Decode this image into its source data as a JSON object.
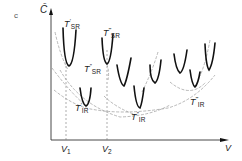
{
  "panel_label": "c",
  "axes": {
    "y_label": "C̄",
    "x_label": "V",
    "x_ticks": [
      {
        "label": "V",
        "sub": "1"
      },
      {
        "label": "V",
        "sub": "2"
      }
    ]
  },
  "labels": {
    "sr1": {
      "main": "T",
      "sub": "SR",
      "prime": "′"
    },
    "sr2": {
      "main": "T",
      "sub": "SR",
      "prime": "″"
    },
    "sr3": {
      "main": "T",
      "sub": "SR",
      "prime": "‴"
    },
    "ir1": {
      "main": "T",
      "sub": "IR",
      "prime": "′"
    },
    "ir2": {
      "main": "T",
      "sub": "IR",
      "prime": "″"
    },
    "ir3": {
      "main": "T",
      "sub": "IR",
      "prime": "‴"
    }
  },
  "colors": {
    "curve": "#111111",
    "envelope": "#888888",
    "axis": "#333333"
  }
}
